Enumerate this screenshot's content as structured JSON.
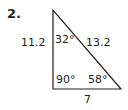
{
  "problem": {
    "number": "2.",
    "sides": {
      "left": "11.2",
      "hypotenuse": "13.2",
      "bottom": "7"
    },
    "angles": {
      "top": "32°",
      "bottom_left": "90°",
      "bottom_right": "58°"
    }
  }
}
